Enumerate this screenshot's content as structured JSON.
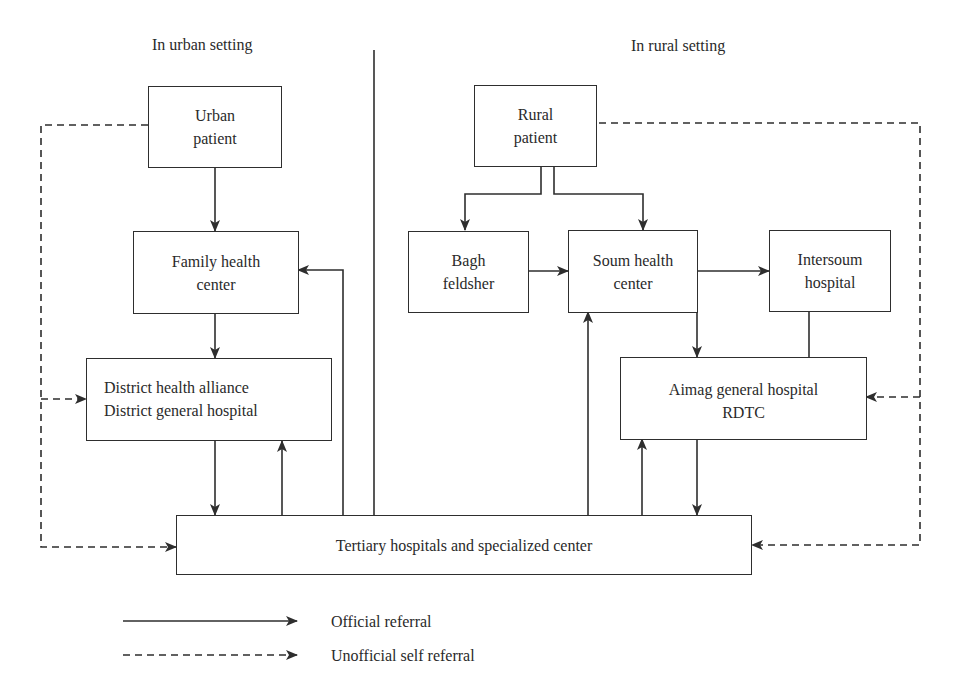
{
  "sections": {
    "urban": "In urban setting",
    "rural": "In rural setting"
  },
  "nodes": {
    "urban_patient": [
      "Urban",
      "patient"
    ],
    "family_health_center": [
      "Family health",
      "center"
    ],
    "district": [
      "District health alliance",
      "District general hospital"
    ],
    "rural_patient": [
      "Rural",
      "patient"
    ],
    "bagh_feldsher": [
      "Bagh",
      "feldsher"
    ],
    "soum_health_center": [
      "Soum health",
      "center"
    ],
    "intersoum_hospital": [
      "Intersoum",
      "hospital"
    ],
    "aimag": [
      "Aimag general hospital",
      "RDTC"
    ],
    "tertiary": [
      "Tertiary hospitals and specialized center"
    ]
  },
  "legend": {
    "official": "Official referral",
    "unofficial": "Unofficial self referral"
  },
  "colors": {
    "line": "#2e2e2e",
    "text": "#2a2a2a",
    "background": "#ffffff"
  }
}
